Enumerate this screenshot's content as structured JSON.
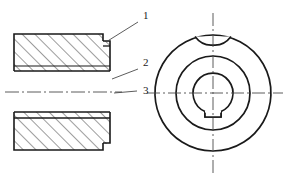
{
  "drawing": {
    "title": "Flanged Bushing Engineering Drawing",
    "background_color": "#ffffff",
    "line_color": "#1a1a1a",
    "hatch_color": "#3c3c3c",
    "centerline_color": "#4a4a4a",
    "leader_color": "#4a4a4a",
    "views": {
      "section_view": {
        "name": "Left Sectional View",
        "description": "Full section of flanged bushing with hatching"
      },
      "front_view": {
        "name": "Right Front View",
        "description": "Concentric circles with top notch and bottom keyway"
      }
    },
    "callouts": [
      {
        "id": "1",
        "label": "1",
        "x": 143,
        "y": 19,
        "leader_from_x": 138,
        "leader_from_y": 22,
        "leader_to_x": 106,
        "leader_to_y": 42
      },
      {
        "id": "2",
        "label": "2",
        "x": 143,
        "y": 66,
        "leader_from_x": 138,
        "leader_from_y": 69,
        "leader_to_x": 112,
        "leader_to_y": 79
      },
      {
        "id": "3",
        "label": "3",
        "x": 143,
        "y": 94,
        "leader_from_x": 137,
        "leader_from_y": 91,
        "leader_to_x": 114,
        "leader_to_y": 93
      }
    ]
  }
}
